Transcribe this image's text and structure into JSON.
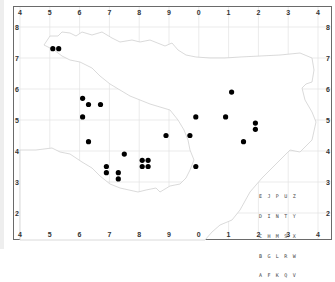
{
  "map": {
    "type": "species distribution dot map",
    "region_outline": "county boundary",
    "grid": {
      "x_ticks": [
        "4",
        "5",
        "6",
        "7",
        "8",
        "9",
        "0",
        "1",
        "2",
        "3",
        "4"
      ],
      "y_ticks": [
        "8",
        "7",
        "6",
        "5",
        "4",
        "3",
        "2"
      ]
    },
    "colors": {
      "frame": "#6a6a6a",
      "gridline": "#e2e2e2",
      "outline": "#d0d0d0",
      "land_fill": "#ffffff",
      "outside_fill": "#f8f8f8",
      "dot": "#000000"
    },
    "dots": [
      {
        "x": 5.1,
        "y": 7.3
      },
      {
        "x": 5.3,
        "y": 7.3
      },
      {
        "x": 6.1,
        "y": 5.7
      },
      {
        "x": 6.3,
        "y": 5.5
      },
      {
        "x": 6.7,
        "y": 5.5
      },
      {
        "x": 6.1,
        "y": 5.1
      },
      {
        "x": 6.3,
        "y": 4.3
      },
      {
        "x": 6.9,
        "y": 3.5
      },
      {
        "x": 6.9,
        "y": 3.3
      },
      {
        "x": 7.3,
        "y": 3.3
      },
      {
        "x": 7.3,
        "y": 3.1
      },
      {
        "x": 7.5,
        "y": 3.9
      },
      {
        "x": 8.1,
        "y": 3.7
      },
      {
        "x": 8.3,
        "y": 3.7
      },
      {
        "x": 8.1,
        "y": 3.5
      },
      {
        "x": 8.3,
        "y": 3.5
      },
      {
        "x": 8.9,
        "y": 4.5
      },
      {
        "x": 9.7,
        "y": 4.5
      },
      {
        "x": 9.9,
        "y": 5.1
      },
      {
        "x": 9.9,
        "y": 3.5
      },
      {
        "x": 10.9,
        "y": 5.1
      },
      {
        "x": 11.1,
        "y": 5.9
      },
      {
        "x": 11.5,
        "y": 4.3
      },
      {
        "x": 11.9,
        "y": 4.9
      },
      {
        "x": 11.9,
        "y": 4.7
      }
    ],
    "tetrad_key": {
      "rows": [
        "E J P U Z",
        "D I N T Y",
        "C H M S X",
        "B G L R W",
        "A F K Q V"
      ]
    }
  }
}
